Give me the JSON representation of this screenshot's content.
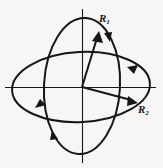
{
  "figure": {
    "background_color": "#f7f6f4",
    "stroke_color": "#161616",
    "center": {
      "x": 82,
      "y": 87
    },
    "axes": {
      "vertical": {
        "x": 82,
        "y_top": 9,
        "y_bottom": 163
      },
      "horizontal": {
        "y": 87,
        "x_left": 5,
        "x_right": 156
      }
    },
    "ellipses": [
      {
        "name": "horizontal-ellipse",
        "orientation": "horizontal",
        "cx": 81,
        "cy": 87,
        "rx": 69,
        "ry": 35,
        "rotation_deg": -3,
        "direction_markers": [
          "upper-right-arrowhead",
          "lower-left-arrowhead"
        ]
      },
      {
        "name": "vertical-ellipse",
        "orientation": "vertical",
        "cx": 82,
        "cy": 86,
        "rx": 38,
        "ry": 68,
        "rotation_deg": 3,
        "direction_markers": [
          "upper-right-arrowhead",
          "lower-left-arrowhead"
        ]
      }
    ],
    "vectors": [
      {
        "name": "vector-r1",
        "label_text": "R",
        "label_subscript": "1",
        "from": {
          "x": 82,
          "y": 87
        },
        "to": {
          "x": 99,
          "y": 33
        }
      },
      {
        "name": "vector-r2",
        "label_text": "R",
        "label_subscript": "2",
        "from": {
          "x": 82,
          "y": 87
        },
        "to": {
          "x": 137,
          "y": 103
        }
      }
    ]
  }
}
